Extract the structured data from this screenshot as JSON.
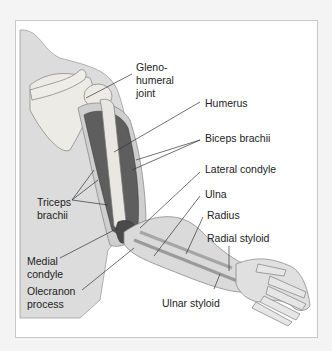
{
  "figure": {
    "type": "anatomical-illustration",
    "colors": {
      "background": "#f4f4f4",
      "frame": "#ffffff",
      "frame_border": "#c8c8c8",
      "skin": "#d6d6d6",
      "bone": "#e6e6e2",
      "muscle": "#5a5a5a",
      "leader_line": "#333333",
      "text": "#222222"
    }
  },
  "labels": {
    "glenohumeral_1": "Gleno-",
    "glenohumeral_2": "humeral",
    "glenohumeral_3": "joint",
    "humerus": "Humerus",
    "biceps": "Biceps brachii",
    "lateral_condyle": "Lateral condyle",
    "ulna": "Ulna",
    "radius": "Radius",
    "radial_styloid": "Radial styloid",
    "triceps_1": "Triceps",
    "triceps_2": "brachii",
    "medial_condyle_1": "Medial",
    "medial_condyle_2": "condyle",
    "olecranon_1": "Olecranon",
    "olecranon_2": "process",
    "ulnar_styloid": "Ulnar styloid"
  }
}
